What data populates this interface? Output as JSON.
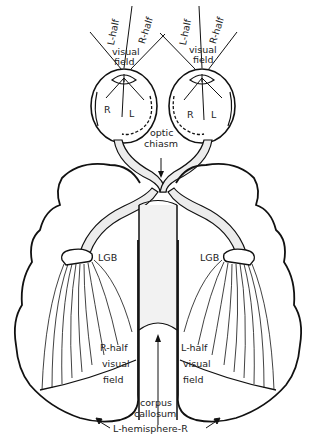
{
  "diagram": {
    "left_eye": {
      "field_labels": {
        "left": "L-half",
        "right": "R-half",
        "center": [
          "visual",
          "field"
        ]
      },
      "retina_labels": {
        "left": "R",
        "right": "L"
      }
    },
    "right_eye": {
      "field_labels": {
        "left": "L-half",
        "right": "R-half",
        "center": [
          "visual",
          "field"
        ]
      },
      "retina_labels": {
        "left": "R",
        "right": "L"
      }
    },
    "chiasm": {
      "line1": "optic",
      "line2": "chiasm"
    },
    "lgb_left": "LGB",
    "lgb_right": "LGB",
    "left_cortex": {
      "line1": "R-half",
      "line2": "visual",
      "line3": "field"
    },
    "right_cortex": {
      "line1": "L-half",
      "line2": "visual",
      "line3": "field"
    },
    "corpus_callosum": {
      "line1": "corpus",
      "line2": "callosum"
    },
    "hemisphere_label": "L-hemisphere-R",
    "colors": {
      "ink": "#111111",
      "nerve_fill": "#e8e8e8",
      "background": "#ffffff"
    }
  }
}
